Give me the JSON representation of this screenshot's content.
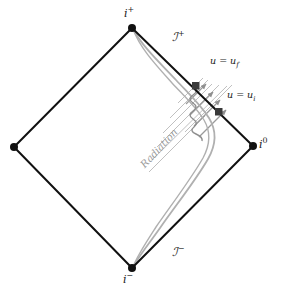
{
  "figure": {
    "kind": "penrose-conformal-diagram",
    "width": 285,
    "height": 296,
    "background_color": "#ffffff"
  },
  "colors": {
    "boundary_line": "#111111",
    "vertex_dot": "#111111",
    "marker_square": "#3a3a3a",
    "worldtube_curve": "#b0b0b0",
    "squiggle": "#8e8e8e",
    "radiation_ray": "#b8b8b8",
    "radiation_arrow": "#9a9a9a",
    "label_text": "#1a1a1a",
    "radiation_label_text": "#9a9a9a"
  },
  "vertices": [
    {
      "name": "future-timelike-infinity",
      "label": "i",
      "superscript": "+",
      "x": 132,
      "y": 28,
      "label_x": 125,
      "label_y": 8,
      "has_label": true
    },
    {
      "name": "spatial-infinity",
      "label": "i",
      "superscript": "0",
      "x": 253,
      "y": 146,
      "label_x": 260,
      "label_y": 140,
      "has_label": true
    },
    {
      "name": "past-timelike-infinity",
      "label": "i",
      "superscript": "−",
      "x": 132,
      "y": 268,
      "label_x": 124,
      "label_y": 272,
      "has_label": true
    },
    {
      "name": "left-vertex",
      "label": "",
      "superscript": "",
      "x": 14,
      "y": 147,
      "label_x": 0,
      "label_y": 0,
      "has_label": false
    }
  ],
  "null_infinity_labels": [
    {
      "name": "future-null-infinity",
      "glyph": "ℐ",
      "superscript": "+",
      "x": 176,
      "y": 36,
      "text": "ℐ⁺"
    },
    {
      "name": "past-null-infinity",
      "glyph": "ℐ",
      "superscript": "−",
      "x": 176,
      "y": 250,
      "text": "ℐ⁻"
    }
  ],
  "retarded_time_labels": [
    {
      "name": "u-final",
      "text": "u = u",
      "subscript": "f",
      "x": 212,
      "y": 61,
      "marker_x": 196,
      "marker_y": 86
    },
    {
      "name": "u-initial",
      "text": "u = u",
      "subscript": "i",
      "x": 229,
      "y": 94,
      "marker_x": 219,
      "marker_y": 112
    }
  ],
  "radiation": {
    "label": "Radiation",
    "label_x": 138,
    "label_y": 160,
    "label_rotation_deg": -47,
    "arrow_count": 4,
    "ray_count": 7
  },
  "worldtube": {
    "name": "collapsing-shell-worldtube",
    "description": "double gray line from i+ bulging right then down to i-"
  }
}
